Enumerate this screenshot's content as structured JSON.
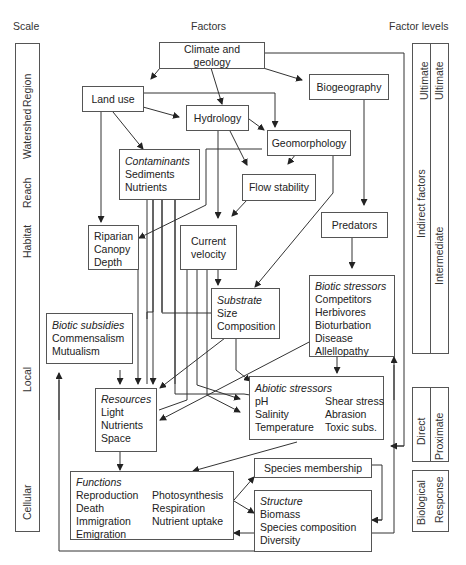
{
  "headers": {
    "scale": "Scale",
    "factors": "Factors",
    "factor_levels": "Factor levels"
  },
  "scale_levels": [
    "Region",
    "Watershed",
    "Reach",
    "Habitat",
    "Local",
    "Cellular"
  ],
  "factor_levels": {
    "ultimate": "Ultimate",
    "indirect": "Indirect factors",
    "intermediate": "Intermediate",
    "direct": "Direct",
    "proximate": "Proximate",
    "biological": "Biological",
    "response": "Respcnse"
  },
  "nodes": {
    "climate": "Climate and geology",
    "land_use": "Land use",
    "biogeography": "Biogeography",
    "hydrology": "Hydrology",
    "geomorphology": "Geomorphology",
    "contaminants": {
      "title": "Contaminants",
      "items": [
        "Sediments",
        "Nutrients"
      ]
    },
    "flow_stability": "Flow stability",
    "predators": "Predators",
    "riparian": {
      "items": [
        "Riparian",
        "Canopy",
        "Depth"
      ]
    },
    "current_velocity": {
      "items": [
        "Current",
        "velocity"
      ]
    },
    "substrate": {
      "title": "Substrate",
      "items": [
        "Size",
        "Composition"
      ]
    },
    "biotic_stressors": {
      "title": "Biotic stressors",
      "items": [
        "Competitors",
        "Herbivores",
        "Bioturbation",
        "Disease",
        "Allellopathy"
      ]
    },
    "biotic_subsidies": {
      "title": "Biotic subsidies",
      "items": [
        "Commensalism",
        "Mutualism"
      ]
    },
    "resources": {
      "title": "Resources",
      "items": [
        "Light",
        "Nutrients",
        "Space"
      ]
    },
    "abiotic_stressors": {
      "title": "Abiotic stressors",
      "left": [
        "pH",
        "Salinity",
        "Temperature"
      ],
      "right": [
        "Shear stress",
        "Abrasion",
        "Toxic subs."
      ]
    },
    "functions": {
      "title": "Functions",
      "left": [
        "Reproduction",
        "Death",
        "Immigration",
        "Emigration"
      ],
      "right": [
        "Photosynthesis",
        "Respiration",
        "Nutrient uptake"
      ]
    },
    "species_membership": "Species membership",
    "structure": {
      "title": "Structure",
      "items": [
        "Biomass",
        "Species composition",
        "Diversity"
      ]
    }
  },
  "colors": {
    "line": "#333333",
    "box_border": "#555555",
    "text": "#222222"
  }
}
